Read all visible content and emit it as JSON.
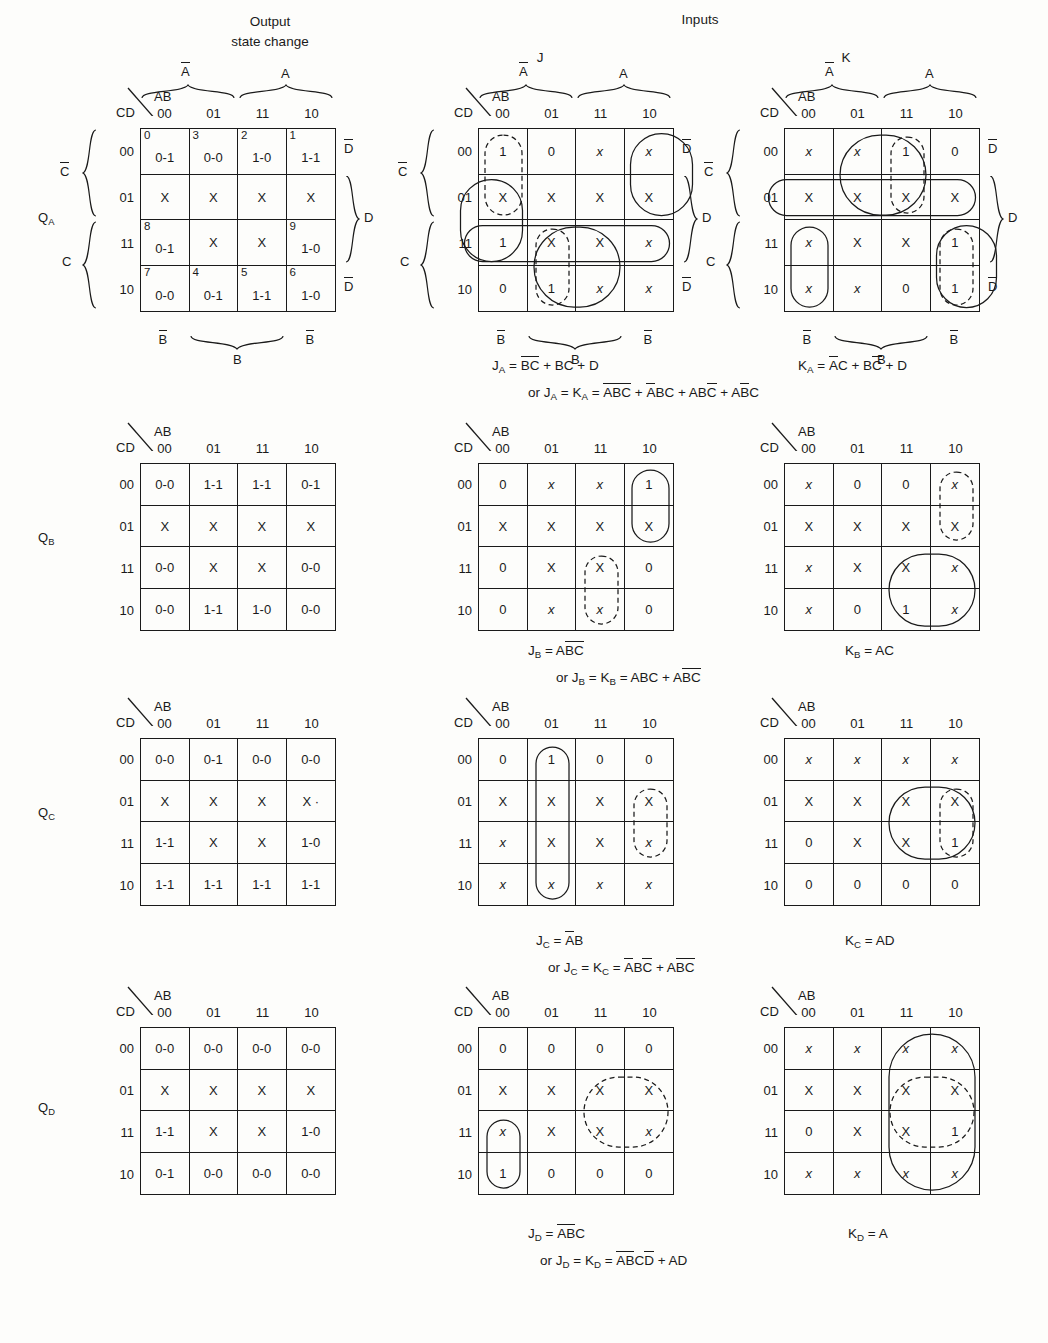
{
  "headers": {
    "output_state_change": "Output\nstate change",
    "inputs": "Inputs",
    "j": "J",
    "k": "K"
  },
  "axis": {
    "ab": "AB",
    "cd": "CD",
    "cols": [
      "00",
      "01",
      "11",
      "10"
    ],
    "rows": [
      "00",
      "01",
      "11",
      "10"
    ],
    "a_bar": "A",
    "a": "A",
    "b_bar": "B",
    "b": "B",
    "c_bar": "C",
    "c": "C",
    "d_bar": "D",
    "d": "D"
  },
  "row_labels": {
    "qa": "Q",
    "qa_sub": "A",
    "qb": "Q",
    "qb_sub": "B",
    "qc": "Q",
    "qc_sub": "C",
    "qd": "Q",
    "qd_sub": "D"
  },
  "maps": {
    "qa_state": {
      "name": "Q_A output state change",
      "cells": [
        {
          "idx": "0",
          "v": "0-1"
        },
        {
          "idx": "3",
          "v": "0-0"
        },
        {
          "idx": "2",
          "v": "1-0"
        },
        {
          "idx": "1",
          "v": "1-1"
        },
        {
          "idx": "",
          "v": "X"
        },
        {
          "idx": "",
          "v": "X"
        },
        {
          "idx": "",
          "v": "X"
        },
        {
          "idx": "",
          "v": "X"
        },
        {
          "idx": "8",
          "v": "0-1"
        },
        {
          "idx": "",
          "v": "X"
        },
        {
          "idx": "",
          "v": "X"
        },
        {
          "idx": "9",
          "v": "1-0"
        },
        {
          "idx": "7",
          "v": "0-0"
        },
        {
          "idx": "4",
          "v": "0-1"
        },
        {
          "idx": "5",
          "v": "1-1"
        },
        {
          "idx": "6",
          "v": "1-0"
        }
      ]
    },
    "qa_j": {
      "name": "J_A map",
      "cells": [
        "1",
        "0",
        "x",
        "x",
        "X",
        "X",
        "X",
        "X",
        "1",
        "X",
        "X",
        "x",
        "0",
        "1",
        "x",
        "x"
      ],
      "italic": [
        false,
        false,
        true,
        true,
        false,
        false,
        false,
        false,
        false,
        false,
        false,
        true,
        false,
        false,
        true,
        true
      ]
    },
    "qa_k": {
      "name": "K_A map",
      "cells": [
        "x",
        "x",
        "1",
        "0",
        "X",
        "X",
        "X",
        "X",
        "x",
        "X",
        "X",
        "1",
        "x",
        "x",
        "0",
        "1"
      ],
      "italic": [
        true,
        true,
        false,
        false,
        false,
        false,
        false,
        false,
        true,
        false,
        false,
        false,
        true,
        true,
        false,
        false
      ]
    },
    "qb_state": {
      "name": "Q_B output state change",
      "cells": [
        "0-0",
        "1-1",
        "1-1",
        "0-1",
        "X",
        "X",
        "X",
        "X",
        "0-0",
        "X",
        "X",
        "0-0",
        "0-0",
        "1-1",
        "1-0",
        "0-0"
      ]
    },
    "qb_j": {
      "name": "J_B map",
      "cells": [
        "0",
        "x",
        "x",
        "1",
        "X",
        "X",
        "X",
        "X",
        "0",
        "X",
        "X",
        "0",
        "0",
        "x",
        "x",
        "0"
      ],
      "italic": [
        false,
        true,
        true,
        false,
        false,
        false,
        false,
        false,
        false,
        false,
        false,
        false,
        false,
        true,
        true,
        false
      ]
    },
    "qb_k": {
      "name": "K_B map",
      "cells": [
        "x",
        "0",
        "0",
        "x",
        "X",
        "X",
        "X",
        "X",
        "x",
        "X",
        "X",
        "x",
        "x",
        "0",
        "1",
        "x"
      ],
      "italic": [
        true,
        false,
        false,
        true,
        false,
        false,
        false,
        false,
        true,
        false,
        false,
        true,
        true,
        false,
        false,
        true
      ]
    },
    "qc_state": {
      "name": "Q_C output state change",
      "cells": [
        "0-0",
        "0-1",
        "0-0",
        "0-0",
        "X",
        "X",
        "X",
        "X ·",
        "1-1",
        "X",
        "X",
        "1-0",
        "1-1",
        "1-1",
        "1-1",
        "1-1"
      ]
    },
    "qc_j": {
      "name": "J_C map",
      "cells": [
        "0",
        "1",
        "0",
        "0",
        "X",
        "X",
        "X",
        "X",
        "x",
        "X",
        "X",
        "x",
        "x",
        "x",
        "x",
        "x"
      ],
      "italic": [
        false,
        false,
        false,
        false,
        false,
        false,
        false,
        false,
        true,
        false,
        false,
        true,
        true,
        true,
        true,
        true
      ]
    },
    "qc_k": {
      "name": "K_C map",
      "cells": [
        "x",
        "x",
        "x",
        "x",
        "X",
        "X",
        "X",
        "X",
        "0",
        "X",
        "X",
        "1",
        "0",
        "0",
        "0",
        "0"
      ],
      "italic": [
        true,
        true,
        true,
        true,
        false,
        false,
        false,
        false,
        false,
        false,
        false,
        false,
        false,
        false,
        false,
        false
      ]
    },
    "qd_state": {
      "name": "Q_D output state change",
      "cells": [
        "0-0",
        "0-0",
        "0-0",
        "0-0",
        "X",
        "X",
        "X",
        "X",
        "1-1",
        "X",
        "X",
        "1-0",
        "0-1",
        "0-0",
        "0-0",
        "0-0"
      ]
    },
    "qd_j": {
      "name": "J_D map",
      "cells": [
        "0",
        "0",
        "0",
        "0",
        "X",
        "X",
        "X",
        "X",
        "x",
        "X",
        "X",
        "x",
        "1",
        "0",
        "0",
        "0"
      ],
      "italic": [
        false,
        false,
        false,
        false,
        false,
        false,
        false,
        false,
        true,
        false,
        false,
        true,
        false,
        false,
        false,
        false
      ]
    },
    "qd_k": {
      "name": "K_D map",
      "cells": [
        "x",
        "x",
        "x",
        "x",
        "X",
        "X",
        "X",
        "X",
        "0",
        "X",
        "X",
        "1",
        "x",
        "x",
        "x",
        "x"
      ],
      "italic": [
        true,
        true,
        true,
        true,
        false,
        false,
        false,
        false,
        false,
        false,
        false,
        false,
        true,
        true,
        true,
        true
      ]
    }
  },
  "equations": {
    "ja": {
      "lhs": "J",
      "lhs_sub": "A",
      "terms": "BC + BC + D"
    },
    "ka": {
      "lhs": "K",
      "lhs_sub": "A",
      "terms": "AC + BC + D"
    },
    "or_a": "or J_A = K_A = ABC + ABC + ABC + ABC",
    "jb": {
      "lhs": "J",
      "lhs_sub": "B",
      "terms": "ABC"
    },
    "kb": {
      "lhs": "K",
      "lhs_sub": "B",
      "terms": "AC"
    },
    "or_b": "or J_B = K_B = ABC + ABC",
    "jc": {
      "lhs": "J",
      "lhs_sub": "C",
      "terms": "AB"
    },
    "kc": {
      "lhs": "K",
      "lhs_sub": "C",
      "terms": "AD"
    },
    "or_c": "or J_C = K_C = ABC + ABC",
    "jd": {
      "lhs": "J",
      "lhs_sub": "D",
      "terms": "ABC"
    },
    "kd": {
      "lhs": "K",
      "lhs_sub": "D",
      "terms": "A"
    },
    "or_d": "or J_D = K_D = ABCD + AD"
  },
  "colors": {
    "ink": "#1a1a1a",
    "paper": "#fdfdfb"
  }
}
